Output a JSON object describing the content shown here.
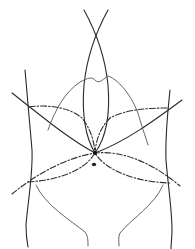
{
  "figure": {
    "type": "line-art anatomical diagram",
    "colors": {
      "background": "#ffffff",
      "line": "#2a2a2a",
      "thin_line": "#555555"
    },
    "features": [
      {
        "name": "torso-outline-left",
        "style": "solid"
      },
      {
        "name": "torso-outline-right",
        "style": "solid"
      },
      {
        "name": "vertical-crossing-curves",
        "style": "solid"
      },
      {
        "name": "diagonal-lines",
        "style": "solid"
      },
      {
        "name": "costal-margin-curve",
        "style": "thin"
      },
      {
        "name": "upper-dashed-arcs",
        "style": "dash-dot"
      },
      {
        "name": "lower-dashed-arcs",
        "style": "dash-dot"
      },
      {
        "name": "inguinal-lines",
        "style": "thin"
      },
      {
        "name": "umbilicus-dot",
        "style": "filled"
      },
      {
        "name": "central-junction-node",
        "style": "filled"
      }
    ]
  }
}
